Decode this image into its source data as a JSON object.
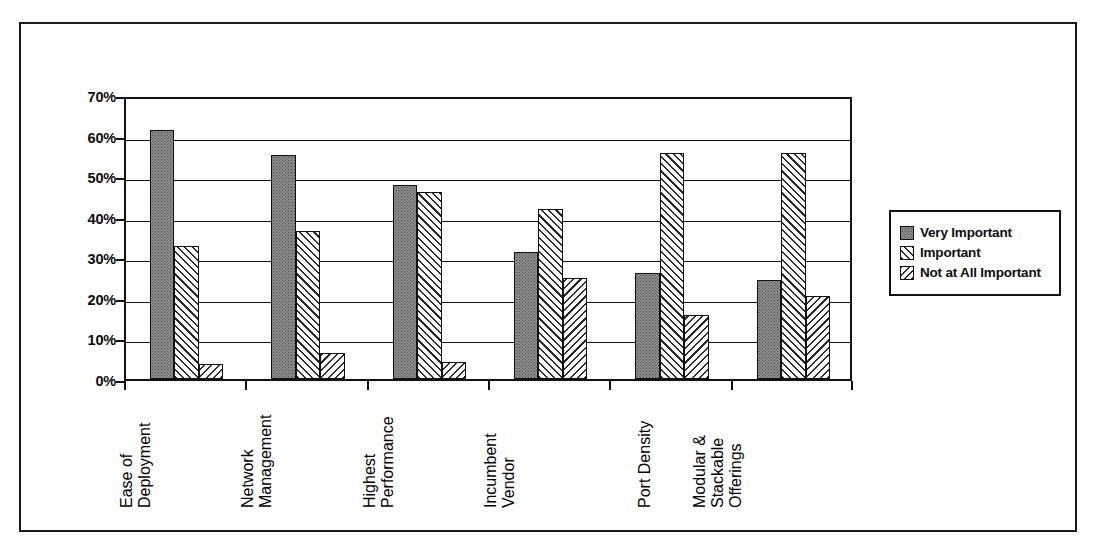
{
  "chart_data": {
    "type": "bar",
    "title": "",
    "subtitle": "",
    "xlabel": "",
    "ylabel": "",
    "ylim": [
      0,
      70
    ],
    "ytick_labels": [
      "0%",
      "10%",
      "20%",
      "30%",
      "40%",
      "50%",
      "60%",
      "70%"
    ],
    "ytick_values": [
      0,
      10,
      20,
      30,
      40,
      50,
      60,
      70
    ],
    "grid": true,
    "legend_position": "right",
    "value_suffix": "%",
    "categories": [
      "Ease of Deployment",
      "Network Management",
      "Highest Performance",
      "Incumbent Vendor",
      "Port Density",
      "Modular & Stackable Offerings"
    ],
    "category_lines": [
      [
        "Ease of",
        "Deployment"
      ],
      [
        "Network",
        "Management"
      ],
      [
        "Highest",
        "Performance"
      ],
      [
        "Incumbent",
        "Vendor"
      ],
      [
        "Port Density"
      ],
      [
        "Modular &",
        "Stackable",
        "Offerings"
      ]
    ],
    "series": [
      {
        "name": "Very Important",
        "pattern": "stipple",
        "values": [
          61.5,
          55.2,
          47.8,
          31.4,
          26.2,
          24.5
        ]
      },
      {
        "name": "Important",
        "pattern": "forward-diagonal",
        "values": [
          32.8,
          36.6,
          46.1,
          41.8,
          55.6,
          55.8
        ]
      },
      {
        "name": "Not at All Important",
        "pattern": "backward-diagonal",
        "values": [
          3.7,
          6.5,
          4.2,
          24.9,
          15.7,
          20.4
        ]
      }
    ]
  },
  "legend": {
    "items": [
      {
        "label": "Very Important"
      },
      {
        "label": "Important"
      },
      {
        "label": "Not at All Important"
      }
    ]
  },
  "colors": {
    "axis": "#111111",
    "text": "#0d0d0d",
    "series_1_fill": "#8e8e8e",
    "series_2_fill": "#ffffff",
    "series_3_fill": "#ffffff",
    "background": "#ffffff"
  }
}
